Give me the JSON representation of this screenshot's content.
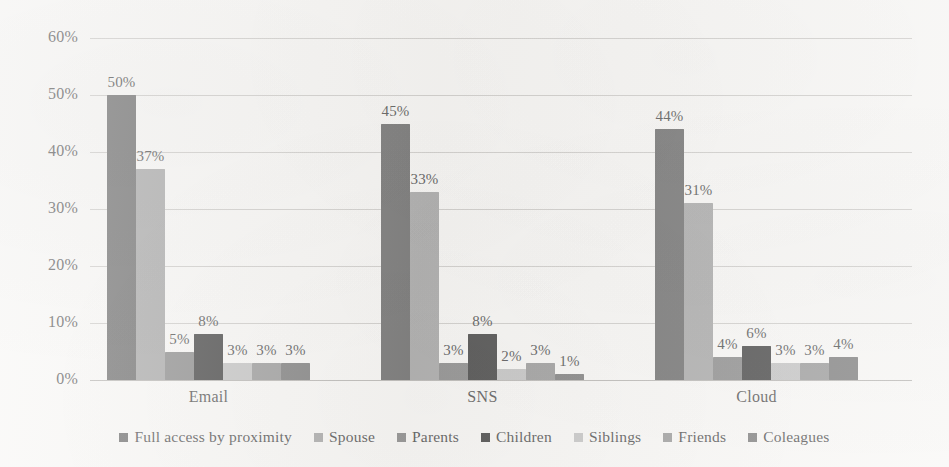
{
  "chart_data": {
    "type": "bar",
    "title": "",
    "subtitle": "",
    "xlabel": "",
    "ylabel": "",
    "categories": [
      "Email",
      "SNS",
      "Cloud"
    ],
    "series": [
      {
        "name": "Full access by proximity",
        "color": "#5c5c5c",
        "values": [
          50,
          45,
          44
        ],
        "labels": [
          "50%",
          "45%",
          "44%"
        ]
      },
      {
        "name": "Spouse",
        "color": "#9d9d9d",
        "values": [
          37,
          33,
          31
        ],
        "labels": [
          "37%",
          "33%",
          "31%"
        ]
      },
      {
        "name": "Parents",
        "color": "#7d7d7d",
        "values": [
          5,
          3,
          4
        ],
        "labels": [
          "5%",
          "3%",
          "4%"
        ]
      },
      {
        "name": "Children",
        "color": "#2f2f2f",
        "values": [
          8,
          8,
          6
        ],
        "labels": [
          "8%",
          "8%",
          "6%"
        ]
      },
      {
        "name": "Siblings",
        "color": "#bcbcbc",
        "values": [
          3,
          2,
          3
        ],
        "labels": [
          "3%",
          "2%",
          "3%"
        ]
      },
      {
        "name": "Friends",
        "color": "#8e8e8e",
        "values": [
          3,
          3,
          3
        ],
        "labels": [
          "3%",
          "3%",
          "3%"
        ]
      },
      {
        "name": "Coleagues",
        "color": "#6e6e6e",
        "values": [
          3,
          1,
          4
        ],
        "labels": [
          "3%",
          "1%",
          "4%"
        ]
      }
    ],
    "ylim": [
      0,
      60
    ],
    "ytick_values": [
      0,
      10,
      20,
      30,
      40,
      50,
      60
    ],
    "ytick_labels": [
      "0%",
      "10%",
      "20%",
      "30%",
      "40%",
      "50%",
      "60%"
    ],
    "grid": true,
    "grid_axis": "y",
    "legend_position": "bottom",
    "value_labels": true,
    "background_color": "#f7f6f4",
    "gridline_color": "#c9c7c4",
    "text_color": "#3a3a3a"
  }
}
